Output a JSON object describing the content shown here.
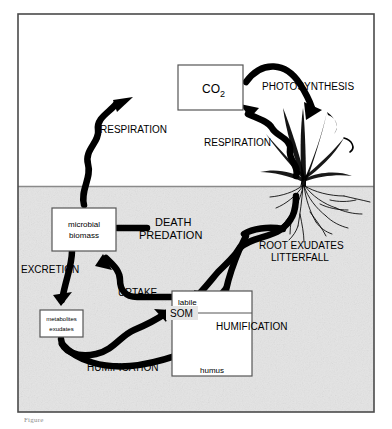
{
  "figure": {
    "caption": "Figure",
    "frame": {
      "border_color": "#4a4a4a",
      "background_above": "#ffffff",
      "background_below": "#e2e2e2"
    }
  },
  "regions": {
    "above_ground": {
      "name": "atmosphere",
      "label": ""
    },
    "below_ground": {
      "name": "soil",
      "label": ""
    }
  },
  "boxes": [
    {
      "id": "co2",
      "label": "CO",
      "sublabel": "2",
      "name": "co2-box"
    },
    {
      "id": "microbial",
      "line1": "microbial",
      "line2": "biomass",
      "name": "microbial-biomass-box"
    },
    {
      "id": "metabolites",
      "line1": "metabolites",
      "line2": "exudates",
      "name": "metabolites-exudates-box"
    },
    {
      "id": "som",
      "label": "SOM",
      "top": "labile",
      "bottom": "humus",
      "name": "som-box"
    }
  ],
  "flow_labels": [
    {
      "id": "respiration_left",
      "text": "RESPIRATION",
      "name": "respiration-left-label"
    },
    {
      "id": "respiration_right",
      "text": "RESPIRATION",
      "name": "respiration-right-label"
    },
    {
      "id": "photosynthesis",
      "text": "PHOTOSYNTHESIS",
      "name": "photosynthesis-label"
    },
    {
      "id": "death",
      "text": "DEATH",
      "name": "death-label"
    },
    {
      "id": "predation",
      "text": "PREDATION",
      "name": "predation-label"
    },
    {
      "id": "root_exudates",
      "text": "ROOT EXUDATES",
      "name": "root-exudates-label"
    },
    {
      "id": "litterfall",
      "text": "LITTERFALL",
      "name": "litterfall-label"
    },
    {
      "id": "excretion",
      "text": "EXCRETION",
      "name": "excretion-label"
    },
    {
      "id": "uptake",
      "text": "UPTAKE",
      "name": "uptake-label"
    },
    {
      "id": "humification_right",
      "text": "HUMIFICATION",
      "name": "humification-right-label"
    },
    {
      "id": "humification_bottom",
      "text": "HUMIFICATION",
      "name": "humification-bottom-label"
    }
  ],
  "colors": {
    "stroke": "#000000",
    "frame": "#4a4a4a",
    "soil_fill": "#e3e3e3",
    "box_fill": "#ffffff",
    "text": "#000000"
  },
  "illustration": {
    "plant": "grass-plant-with-roots",
    "name": "plant-illustration"
  }
}
